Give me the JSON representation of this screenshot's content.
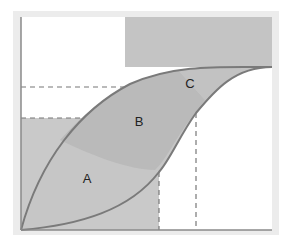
{
  "diagram": {
    "regions": [
      {
        "id": "A",
        "label": "A",
        "x": 87,
        "y": 178
      },
      {
        "id": "B",
        "label": "B",
        "x": 139,
        "y": 121
      },
      {
        "id": "C",
        "label": "C",
        "x": 190,
        "y": 83
      }
    ],
    "colors": {
      "outer_frame": "#ececec",
      "plot_background": "#ffffff",
      "shade_light": "#c9c9c9",
      "shade_mid": "#bdbdbd",
      "shade_dark": "#b3b3b3",
      "top_rect": "#c4c4c4",
      "curve": "#7a7a7a",
      "axis": "#8a8a8a",
      "dashed": "#777777",
      "label": "#222222"
    }
  }
}
